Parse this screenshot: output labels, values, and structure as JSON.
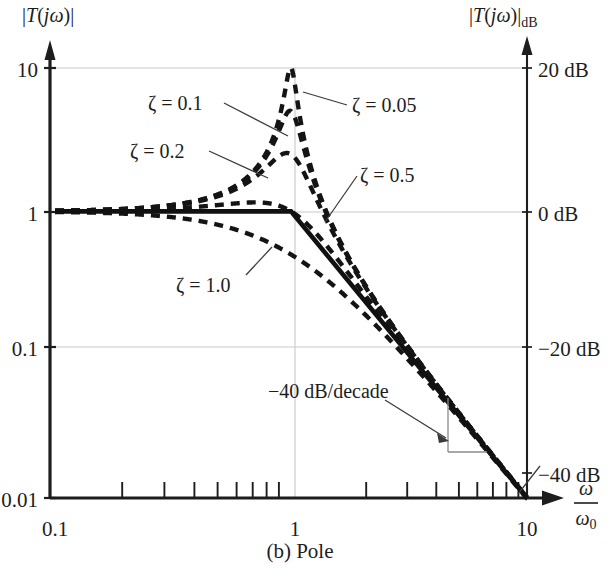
{
  "figure": {
    "caption": "(b) Pole",
    "left_axis_label_parts": {
      "bar1": "|",
      "T": "T",
      "open": "(",
      "j": "j",
      "omega": "ω",
      "close": ")",
      "bar2": "|"
    },
    "left_axis_label": "|T(jω)|",
    "right_axis_label": "|T(jω)|",
    "right_axis_label_sub": "dB",
    "x_axis_label_num": "ω",
    "x_axis_label_den": "ω",
    "x_axis_label_den_sub": "0",
    "slope_annotation": "−40 dB/decade",
    "colors": {
      "ink": "#1d1d1d",
      "grid": "#c9c9c9",
      "curve": "#141414"
    }
  },
  "chart_data": {
    "type": "line",
    "title": "(b) Pole",
    "xlabel": "ω/ω₀",
    "ylabel": "|T(jω)|",
    "ylabel_right": "|T(jω)|dB",
    "xscale": "log",
    "yscale": "log",
    "xlim": [
      0.1,
      10
    ],
    "ylim": [
      0.01,
      10
    ],
    "grid": true,
    "legend_position": "inline-annotations",
    "x_ticks": [
      "0.1",
      "1",
      "10"
    ],
    "x_tick_values": [
      0.1,
      1,
      10
    ],
    "x_minor_ticks": [
      0.2,
      0.3,
      0.4,
      0.5,
      0.6,
      0.7,
      0.8,
      0.9,
      2,
      3,
      4,
      5,
      6,
      7,
      8,
      9
    ],
    "y_ticks": [
      "10",
      "1",
      "0.1",
      "0.01"
    ],
    "y_tick_values": [
      10,
      1,
      0.1,
      0.01
    ],
    "y_ticks_right": [
      "20 dB",
      "0 dB",
      "−20 dB",
      "−40 dB"
    ],
    "y_tick_values_right": [
      20,
      0,
      -20,
      -40
    ],
    "asymptote": {
      "name": "straight-line (Bode) asymptote",
      "style": "solid",
      "points": [
        [
          0.1,
          1.0
        ],
        [
          1.0,
          1.0
        ],
        [
          10.0,
          0.01
        ]
      ],
      "slope_db_per_decade": -40
    },
    "series": [
      {
        "name": "ζ = 0.05",
        "zeta": 0.05,
        "style": "dashed",
        "peak": {
          "x": 0.9987,
          "y": 10.0,
          "y_db": 20.0
        },
        "label_text": "ζ = 0.05"
      },
      {
        "name": "ζ = 0.1",
        "zeta": 0.1,
        "style": "dashed",
        "peak": {
          "x": 0.99,
          "y": 5.02,
          "y_db": 14.0
        },
        "label_text": "ζ = 0.1"
      },
      {
        "name": "ζ = 0.2",
        "zeta": 0.2,
        "style": "dashed",
        "peak": {
          "x": 0.959,
          "y": 2.55,
          "y_db": 8.1
        },
        "label_text": "ζ = 0.2"
      },
      {
        "name": "ζ = 0.5",
        "zeta": 0.5,
        "style": "dashed",
        "peak": {
          "x": 0.707,
          "y": 1.155,
          "y_db": 1.25
        },
        "label_text": "ζ = 0.5"
      },
      {
        "name": "ζ = 1.0",
        "zeta": 1.0,
        "style": "dashed",
        "peak": {
          "x": 0.0,
          "y": 1.0,
          "y_db": 0.0
        },
        "label_text": "ζ = 1.0"
      }
    ],
    "annotations": [
      {
        "text": "−40 dB/decade",
        "x": 3.1,
        "y": 0.072
      }
    ]
  }
}
